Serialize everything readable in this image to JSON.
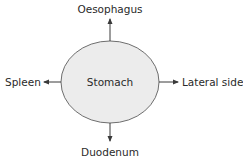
{
  "diagram": {
    "center_node": {
      "label": "Stomach",
      "fill": "#ececec",
      "stroke": "#6e6e6e"
    },
    "relations": [
      {
        "direction": "up",
        "label": "Oesophagus"
      },
      {
        "direction": "left",
        "label": "Spleen"
      },
      {
        "direction": "right",
        "label": "Lateral side"
      },
      {
        "direction": "down",
        "label": "Duodenum"
      }
    ],
    "colors": {
      "arrow": "#3a3a3a",
      "text": "#2a2a2a",
      "background": "#ffffff"
    }
  }
}
